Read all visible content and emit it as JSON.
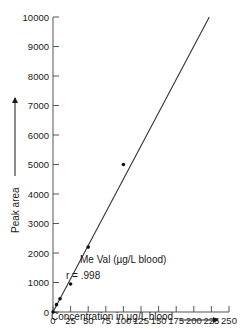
{
  "chart_data": {
    "type": "scatter",
    "title": "",
    "xlabel": "Concentration in µg/L blood",
    "ylabel": "Peak area",
    "xlim": [
      0,
      250
    ],
    "ylim": [
      0,
      10000
    ],
    "x_ticks": [
      0,
      25,
      50,
      75,
      100,
      125,
      150,
      175,
      200,
      225,
      250
    ],
    "y_ticks": [
      0,
      1000,
      2000,
      3000,
      4000,
      5000,
      6000,
      7000,
      8000,
      9000,
      10000
    ],
    "x_tick_labels": [
      "0",
      "25",
      "50",
      "75",
      "100",
      "125",
      "150",
      "175",
      "200",
      "225",
      "250"
    ],
    "y_tick_labels": [
      "0",
      "1000",
      "2000",
      "3000",
      "4000",
      "5000",
      "6000",
      "7000",
      "8000",
      "9000",
      "10000"
    ],
    "grid": false,
    "legend": null,
    "series": [
      {
        "name": "Me Val (µg/L blood)",
        "points": [
          {
            "x": 0,
            "y": 0
          },
          {
            "x": 5,
            "y": 250
          },
          {
            "x": 10,
            "y": 450
          },
          {
            "x": 25,
            "y": 950
          },
          {
            "x": 50,
            "y": 2200
          },
          {
            "x": 100,
            "y": 5000
          }
        ]
      }
    ],
    "fit_line": {
      "type": "linear",
      "x_start": 0,
      "y_start": 0,
      "x_end": 222,
      "y_end": 10000
    },
    "annotations": [
      {
        "text": "Me Val (µg/L blood)",
        "x": 40,
        "y": 1050
      },
      {
        "text": "r = .998",
        "x": 40,
        "y": 450
      }
    ]
  },
  "labels": {
    "x_axis_title": "Concentration in µg/L blood",
    "y_axis_title": "Peak area",
    "series_label": "Me Val (µg/L blood)",
    "r_value": "r = .998"
  },
  "colors": {
    "ink": "#1a1a1a",
    "axis": "#555555",
    "background": "#ffffff"
  }
}
